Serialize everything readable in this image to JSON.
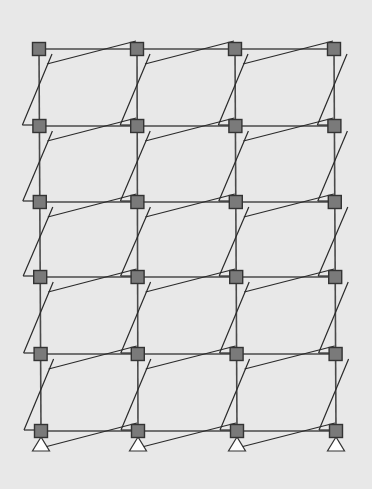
{
  "diagram": {
    "type": "structural-frame-deformed-shape",
    "colors": {
      "background": "#e8e8e8",
      "frame_line": "#4a4a4a",
      "deformed_line": "#2a2a2a",
      "node_fill": "#7a7a7a",
      "node_stroke": "#333333",
      "support_fill": "#ffffff",
      "support_stroke": "#333333"
    },
    "columns_x": [
      39,
      137,
      235,
      334
    ],
    "rows_y": [
      49,
      126,
      202,
      277,
      354,
      431
    ],
    "bottom_columns_x": [
      41,
      138,
      237,
      336
    ],
    "node_size": 13,
    "deformation": {
      "beam_left_drop": 15,
      "beam_right_rise": 8,
      "column_bottom_shift": -17,
      "column_top_shift": 13
    },
    "supports": [
      {
        "x": 41,
        "y": 437,
        "type": "pin"
      },
      {
        "x": 138,
        "y": 437,
        "type": "pin"
      },
      {
        "x": 237,
        "y": 437,
        "type": "pin"
      },
      {
        "x": 336,
        "y": 437,
        "type": "pin"
      }
    ],
    "counts": {
      "bays": 3,
      "stories": 5,
      "nodes": 24,
      "supports": 4
    }
  }
}
